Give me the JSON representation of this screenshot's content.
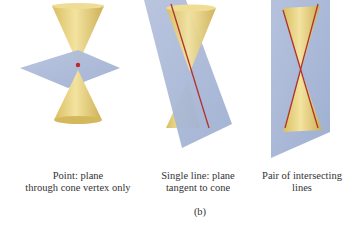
{
  "figure": {
    "panels": [
      {
        "id": "point",
        "caption_line1": "Point: plane",
        "caption_line2": "through cone vertex only"
      },
      {
        "id": "single-line",
        "caption_line1": "Single line: plane",
        "caption_line2": "tangent to cone"
      },
      {
        "id": "pair-of-lines",
        "caption_line1": "Pair of intersecting",
        "caption_line2": "lines"
      }
    ],
    "sublabel": "(b)",
    "colors": {
      "cone": "#e8d27a",
      "cone_shade": "#c9ae52",
      "plane": "#a9b7d6",
      "line": "#b0332a"
    }
  }
}
